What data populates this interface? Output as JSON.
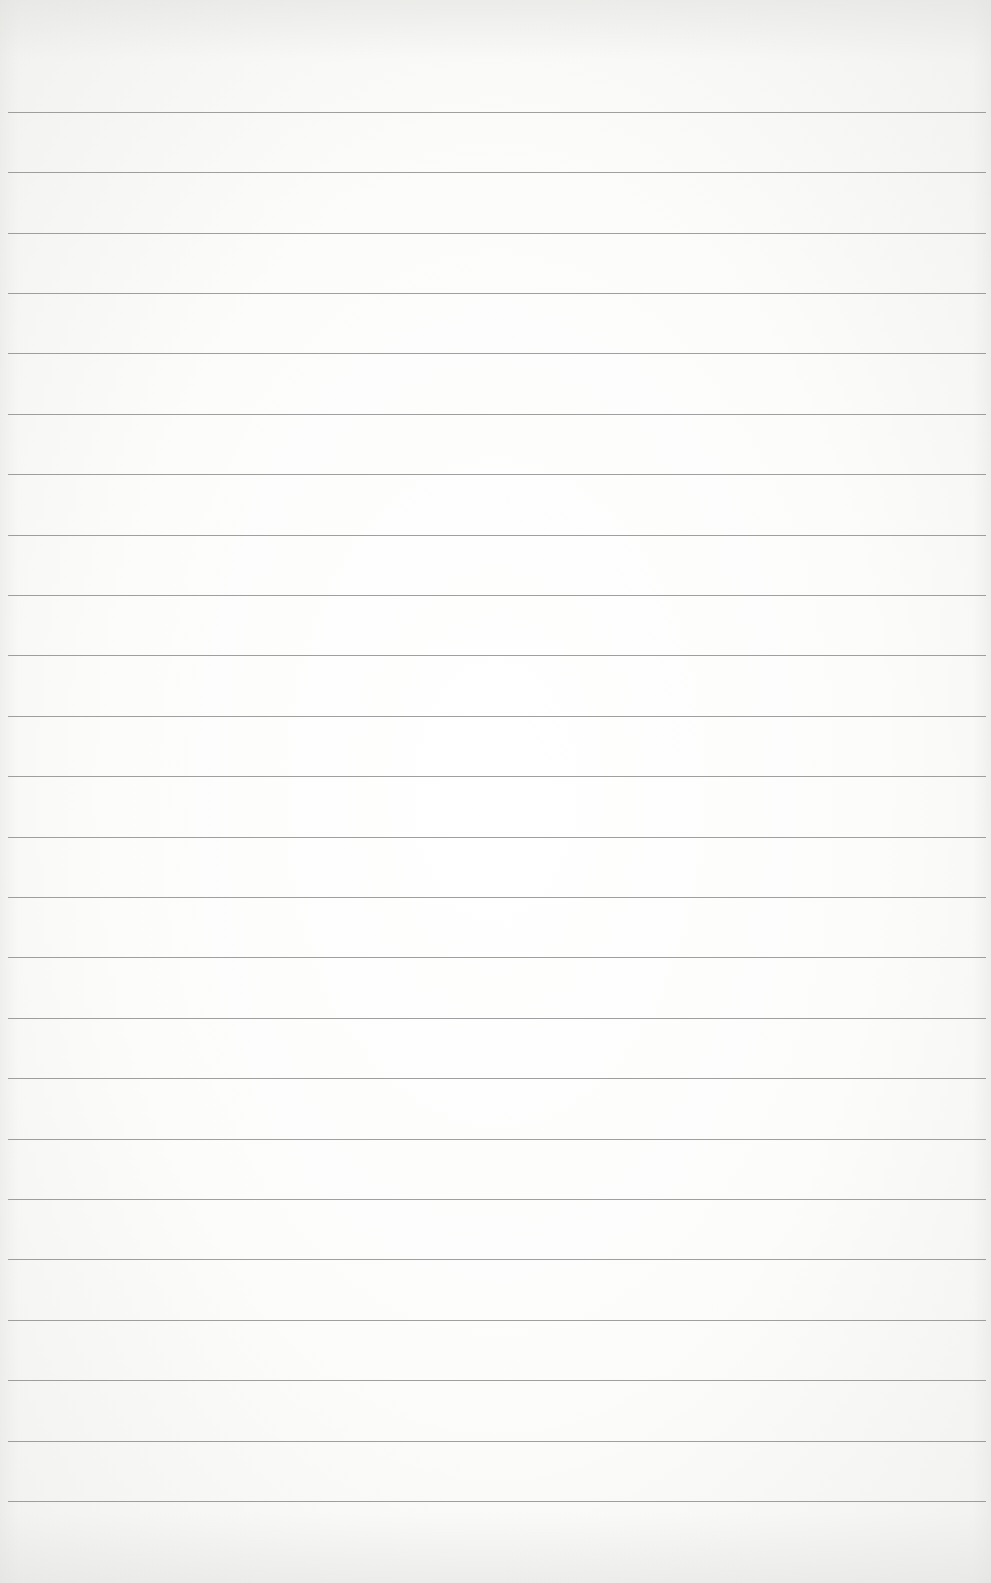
{
  "page": {
    "type": "lined-paper",
    "background_color": "#fcfcfb",
    "rule_color": "#8e8e8e",
    "rule_count": 24,
    "rule_positions_y": [
      112,
      172,
      233,
      293,
      353,
      414,
      474,
      535,
      595,
      655,
      716,
      776,
      837,
      897,
      957,
      1018,
      1078,
      1139,
      1199,
      1259,
      1320,
      1380,
      1441,
      1501
    ]
  }
}
